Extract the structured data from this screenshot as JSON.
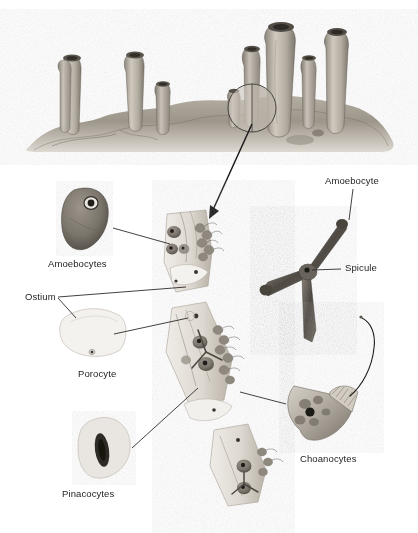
{
  "figure": {
    "title_visible": false,
    "corner_mark": "·"
  },
  "palette": {
    "ink": "#1d1d1d",
    "leader_line": "#231f20",
    "sponge_body_light": "#d8d3c9",
    "sponge_body_mid": "#a49d92",
    "sponge_body_dark": "#6f685f",
    "substrate_light": "#cfcabf",
    "substrate_dark": "#746d63",
    "amoebocyte_fill": "#7d776e",
    "amoebocyte_dark": "#4a443d",
    "spicule_fill": "#5f5a53",
    "porocyte_fill": "#f2f0ec",
    "pinacocyte_fill": "#e6e3dd",
    "choanocyte_fill": "#bfb9b0",
    "nucleus": "#2a2622",
    "background": "#ffffff"
  },
  "scene": {
    "name": "sponge-colony-habitat",
    "description": "tube sponges on rocky substrate",
    "tube_count": 9,
    "magnifier": {
      "name": "magnification-circle",
      "cx": 252,
      "cy": 108,
      "r": 24
    },
    "arrow": {
      "name": "magnification-arrow",
      "from_x": 252,
      "from_y": 124,
      "to_x": 209,
      "to_y": 218
    }
  },
  "wall": {
    "name": "sponge-wall-cross-section",
    "segments": 3,
    "note": "magnified body wall showing cell layers"
  },
  "callouts": [
    {
      "id": "amoebocytes",
      "label": "Amoebocytes",
      "label_x": 48,
      "label_y": 260,
      "cell_x": 60,
      "cell_y": 186,
      "leader": [
        [
          122,
          229
        ],
        [
          170,
          243
        ]
      ]
    },
    {
      "id": "ostium",
      "label": "Ostium",
      "label_x": 25,
      "label_y": 294,
      "cell_x": 60,
      "cell_y": 306,
      "leader": [
        [
          60,
          298
        ],
        [
          186,
          288
        ]
      ]
    },
    {
      "id": "porocyte",
      "label": "Porocyte",
      "label_x": 78,
      "label_y": 370,
      "cell_x": 60,
      "cell_y": 306,
      "leader": [
        [
          113,
          328
        ],
        [
          186,
          318
        ]
      ]
    },
    {
      "id": "pinacocytes",
      "label": "Pinacocytes",
      "label_x": 62,
      "label_y": 490,
      "cell_x": 80,
      "cell_y": 425,
      "leader": [
        [
          137,
          445
        ],
        [
          196,
          385
        ]
      ]
    },
    {
      "id": "amoebocyte",
      "label": "Amoebocyte",
      "label_x": 325,
      "label_y": 177,
      "leader": [
        [
          353,
          188
        ],
        [
          353,
          219
        ]
      ]
    },
    {
      "id": "spicule",
      "label": "Spicule",
      "label_x": 345,
      "label_y": 264,
      "leader": [
        [
          341,
          269
        ],
        [
          311,
          269
        ]
      ]
    },
    {
      "id": "choanocytes",
      "label": "Choanocytes",
      "label_x": 300,
      "label_y": 455,
      "cell_x": 290,
      "cell_y": 378,
      "leader": [
        [
          285,
          404
        ],
        [
          240,
          392
        ]
      ]
    }
  ]
}
